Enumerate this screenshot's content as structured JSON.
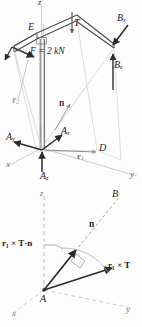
{
  "figure": {
    "kind": "engineering-free-body-diagram",
    "ink_color": "#2b2b2b",
    "faint_color": "#b9b9b9",
    "mid_color": "#8c8c8c",
    "background": "#fdfdfd"
  },
  "upper_diagram": {
    "name": "bent-bar-free-body",
    "axes": {
      "z_top": "z",
      "x": "x",
      "y": "y",
      "z_lower": "z"
    },
    "points": {
      "E": "E",
      "A": "A",
      "D": "D"
    },
    "loads": {
      "tension": "T",
      "force_magnitude": "F = 2 kN",
      "force_symbol": "F",
      "force_value": "2 kN"
    },
    "reactions": {
      "Bx": {
        "base": "B",
        "sub": "x"
      },
      "Bz": {
        "base": "B",
        "sub": "z"
      },
      "Ax": {
        "base": "A",
        "sub": "x"
      },
      "Ay": {
        "base": "A",
        "sub": "y"
      },
      "Az": {
        "base": "A",
        "sub": "z"
      }
    },
    "vectors": {
      "r2": {
        "base": "r",
        "sub": "2"
      },
      "r1": {
        "base": "r",
        "sub": "1"
      },
      "normal": "n"
    }
  },
  "lower_diagram": {
    "name": "moment-projection-diagram",
    "axes": {
      "z": "z",
      "x": "x",
      "y": "y"
    },
    "points": {
      "A": "A",
      "B": "B"
    },
    "vectors": {
      "normal": "n",
      "moment": {
        "r": "r",
        "sub": "1",
        "cross": "×",
        "T": "T"
      },
      "moment_label": "r₁ × T",
      "projection_label": "r₁ × T·n"
    }
  }
}
